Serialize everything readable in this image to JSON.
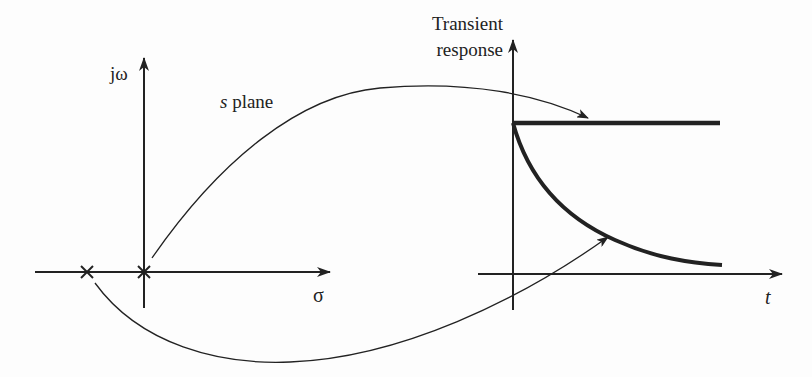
{
  "figure": {
    "type": "pole-location-to-transient-response-diagram",
    "left_panel": {
      "title": "s plane",
      "title_italic_part": "s",
      "title_rest": " plane",
      "vertical_axis_label": "jω",
      "horizontal_axis_label": "σ",
      "poles": [
        {
          "label": "pole-at-origin",
          "marker": "×",
          "location": "origin"
        },
        {
          "label": "pole-on-negative-real-axis",
          "marker": "×",
          "location": "negative real axis"
        }
      ]
    },
    "right_panel": {
      "vertical_axis_label_line1": "Transient",
      "vertical_axis_label_line2": "response",
      "horizontal_axis_label": "t",
      "curves": [
        {
          "name": "step-response",
          "shape": "constant",
          "from_pole": "pole-at-origin"
        },
        {
          "name": "exponential-decay",
          "shape": "decaying exponential",
          "from_pole": "pole-on-negative-real-axis"
        }
      ]
    },
    "colors": {
      "ink": "#222222",
      "background": "#fdfdfd"
    }
  }
}
